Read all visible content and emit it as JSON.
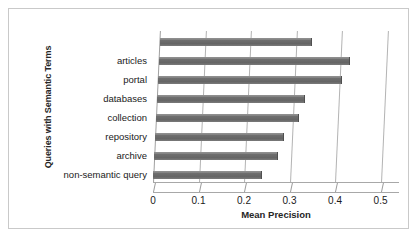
{
  "chart_data": {
    "type": "bar",
    "orientation": "horizontal",
    "title": "",
    "xlabel": "Mean Precision",
    "ylabel": "Queries with Semantic Terms",
    "xlim": [
      0,
      0.5
    ],
    "xticks": [
      "0",
      "0.1",
      "0.2",
      "0.3",
      "0.4",
      "0.5"
    ],
    "xtick_values": [
      0,
      0.1,
      0.2,
      0.3,
      0.4,
      0.5
    ],
    "grid": true,
    "legend": "none",
    "bar_color": "#6e6e6e",
    "categories": [
      "",
      "articles",
      "portal",
      "databases",
      "collection",
      "repository",
      "archive",
      "non-semantic query"
    ],
    "values": [
      0.335,
      0.42,
      0.405,
      0.325,
      0.315,
      0.283,
      0.273,
      0.24
    ],
    "series": [
      {
        "name": "Mean Precision",
        "values": [
          0.335,
          0.42,
          0.405,
          0.325,
          0.315,
          0.283,
          0.273,
          0.24
        ]
      }
    ]
  }
}
